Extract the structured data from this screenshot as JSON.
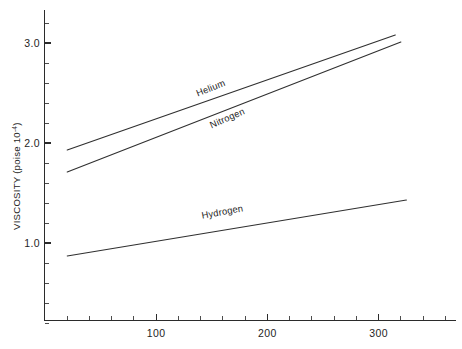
{
  "chart_data": {
    "type": "line",
    "title": "",
    "xlabel": "",
    "ylabel": "VISCOSITY (poise 10",
    "ylabel_exponent": "-4",
    "ylabel_suffix": ")",
    "xlim": [
      0,
      370
    ],
    "ylim": [
      0,
      3.35
    ],
    "grid": false,
    "legend_position": "inline-labels",
    "x_ticks_major": [
      100,
      200,
      300
    ],
    "x_tick_labels": [
      "100",
      "200",
      "300"
    ],
    "x_ticks_minor": [
      20,
      40,
      60,
      80,
      120,
      140,
      160,
      180,
      220,
      240,
      260,
      280,
      320,
      340,
      360
    ],
    "y_ticks_major": [
      1.0,
      2.0,
      3.0
    ],
    "y_tick_labels": [
      "1.0",
      "2.0",
      "3.0"
    ],
    "y_ticks_minor": [
      0.2,
      0.4,
      0.6,
      0.8,
      1.2,
      1.4,
      1.6,
      1.8,
      2.2,
      2.4,
      2.6,
      2.8,
      3.2
    ],
    "series": [
      {
        "name": "Helium",
        "label": "Helium",
        "x": [
          20,
          315
        ],
        "values": [
          1.93,
          3.08
        ],
        "label_x": 150,
        "label_y": 2.52,
        "label_angle": -21.5
      },
      {
        "name": "Nitrogen",
        "label": "Nitrogen",
        "x": [
          20,
          320
        ],
        "values": [
          1.71,
          3.01
        ],
        "label_x": 165,
        "label_y": 2.22,
        "label_angle": -23.5
      },
      {
        "name": "Hydrogen",
        "label": "Hydrogen",
        "x": [
          20,
          325
        ],
        "values": [
          0.87,
          1.43
        ],
        "label_x": 160,
        "label_y": 1.28,
        "label_angle": -10.5
      }
    ],
    "colors": {
      "line": "#303030",
      "axis": "#2b2b2b",
      "text": "#1e1e1e",
      "background": "#ffffff"
    }
  }
}
